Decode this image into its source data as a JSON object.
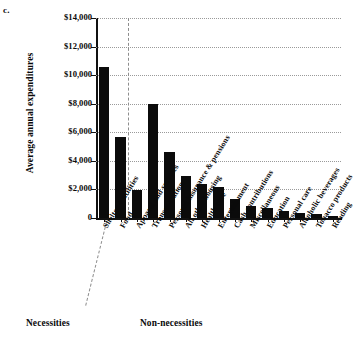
{
  "panel": {
    "label": "c."
  },
  "chart_data": {
    "type": "bar",
    "title": "",
    "subtitle": "",
    "xlabel": "",
    "ylabel": "Average annual expenditures",
    "ylim": [
      0,
      14000
    ],
    "ytick_labels": [
      "$14,000",
      "$12,000",
      "$10,000",
      "$8,000",
      "$6,000",
      "$4,000",
      "$2,000",
      "0"
    ],
    "ytick_values": [
      14000,
      12000,
      10000,
      8000,
      6000,
      4000,
      2000,
      0
    ],
    "grid": true,
    "legend_position": "none",
    "bar_color": "#0b0b0b",
    "categories": [
      "Shelter + utilities",
      "Food",
      "Apparel and services",
      "Transportation",
      "Personal insurance & pensions",
      "All other housing",
      "Health care",
      "Entertainment",
      "Cash contributions",
      "Miscellaneous",
      "Education",
      "Personal care",
      "Alcoholic beverages",
      "Tobacco products",
      "Reading"
    ],
    "values": [
      10550,
      5650,
      1950,
      8000,
      4600,
      2950,
      2350,
      2150,
      1350,
      820,
      700,
      500,
      350,
      270,
      120
    ],
    "groups": [
      {
        "name": "Necessities",
        "categories": [
          "Shelter + utilities",
          "Food",
          "Apparel and services"
        ]
      },
      {
        "name": "Non-necessities",
        "categories": [
          "Transportation",
          "Personal insurance & pensions",
          "All other housing",
          "Health care",
          "Entertainment",
          "Cash contributions",
          "Miscellaneous",
          "Education",
          "Personal care",
          "Alcoholic beverages",
          "Tobacco products",
          "Reading"
        ]
      }
    ],
    "annotations": [
      {
        "name": "group-divider",
        "type": "dashed-line",
        "orientation": "vertical"
      }
    ]
  },
  "captions": {
    "necessities": "Necessities",
    "non_necessities": "Non-necessities"
  }
}
